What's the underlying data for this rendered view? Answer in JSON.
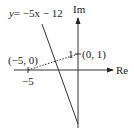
{
  "diagram": {
    "type": "complex-plane",
    "axes": {
      "horizontal_label": "Re",
      "vertical_label": "Im"
    },
    "line_equation": {
      "lhs": "y",
      "rhs": "= −5x − 12"
    },
    "points": [
      {
        "label": "(−5, 0)",
        "x": -5,
        "y": 0
      },
      {
        "label": "(0, 1)",
        "x": 0,
        "y": 1
      }
    ],
    "ticks": {
      "x_tick_label": "−5",
      "y_tick_label": "1"
    },
    "colors": {
      "ink": "#222222",
      "background": "#ffffff"
    }
  }
}
